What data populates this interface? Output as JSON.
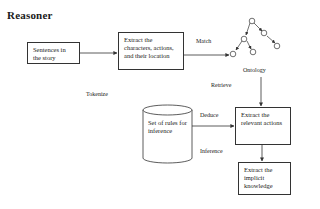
{
  "title": "Reasoner",
  "nodes": {
    "sentences": "Sentences in the story",
    "extract_characters": "Extract the characters, actions, and their location",
    "rules": "Set of rules for inference",
    "extract_actions": "Extract the relevant actions",
    "extract_knowledge": "Extract the implicit knowledge"
  },
  "edge_labels": {
    "tokenize": "Tokenize",
    "match": "Match",
    "ontology": "Ontology",
    "retrieve": "Retrieve",
    "deduce": "Deduce",
    "inference": "Inference"
  },
  "colors": {
    "line": "#333333",
    "background": "#ffffff"
  }
}
